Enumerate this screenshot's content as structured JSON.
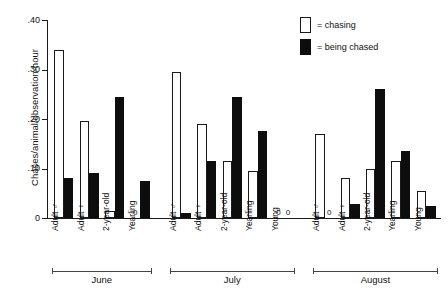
{
  "chart_data": {
    "type": "bar",
    "title": "",
    "xlabel": "",
    "ylabel": "Chases/animal/observation-hour",
    "ylim": [
      0,
      0.4
    ],
    "yticks": [
      "0",
      ".10",
      ".20",
      ".30",
      ".40"
    ],
    "ytick_values": [
      0,
      0.1,
      0.2,
      0.3,
      0.4
    ],
    "grid": false,
    "legend_position": "top-right",
    "legend": [
      {
        "swatch": "open",
        "text": "= chasing"
      },
      {
        "swatch": "filled",
        "text": "= being chased"
      }
    ],
    "series": [
      {
        "name": "chasing",
        "fill": "open"
      },
      {
        "name": "being chased",
        "fill": "filled"
      }
    ],
    "groups": [
      {
        "label": "June",
        "categories": [
          "Adult ♂",
          "Adult ♀",
          "2-year-old",
          "Yearling"
        ],
        "chasing": [
          0.34,
          0.195,
          0.015,
          0
        ],
        "being_chased": [
          0.08,
          0.09,
          0.245,
          0.075
        ],
        "zero_labels": {
          "chasing": [
            false,
            false,
            false,
            true
          ],
          "being_chased": [
            false,
            false,
            false,
            false
          ]
        }
      },
      {
        "label": "July",
        "categories": [
          "Adult ♂",
          "Adult ♀",
          "2-year-old",
          "Yearling",
          "Young"
        ],
        "chasing": [
          0.295,
          0.19,
          0.115,
          0.095,
          0
        ],
        "being_chased": [
          0.01,
          0.115,
          0.245,
          0.175,
          0
        ],
        "zero_labels": {
          "chasing": [
            false,
            false,
            false,
            false,
            true
          ],
          "being_chased": [
            false,
            false,
            false,
            false,
            true
          ]
        }
      },
      {
        "label": "August",
        "categories": [
          "Adult ♂",
          "Adult ♀",
          "2-year-old",
          "Yearling",
          "Young"
        ],
        "chasing": [
          0.17,
          0.08,
          0.1,
          0.115,
          0.055
        ],
        "being_chased": [
          0,
          0.028,
          0.26,
          0.135,
          0.025
        ],
        "zero_labels": {
          "chasing": [
            false,
            false,
            false,
            false,
            false
          ],
          "being_chased": [
            true,
            false,
            false,
            false,
            false
          ]
        }
      }
    ]
  },
  "colors": {
    "chasing": "#ffffff",
    "being_chased": "#0d0d0d",
    "axis": "#1a1a1a",
    "background": "#ffffff"
  }
}
